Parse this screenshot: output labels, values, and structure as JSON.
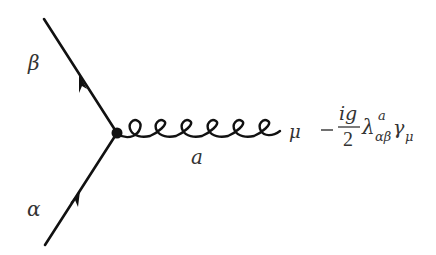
{
  "diagram": {
    "type": "feynman-vertex",
    "vertex": {
      "x": 117,
      "y": 133
    },
    "fermion_lines": [
      {
        "name": "outgoing-quark",
        "from": {
          "x": 117,
          "y": 133
        },
        "to": {
          "x": 44,
          "y": 19
        },
        "label": "β",
        "arrow_direction": "away-from-vertex"
      },
      {
        "name": "incoming-quark",
        "from": {
          "x": 45,
          "y": 245
        },
        "to": {
          "x": 117,
          "y": 133
        },
        "label": "α",
        "arrow_direction": "toward-vertex"
      }
    ],
    "gluon_line": {
      "from": {
        "x": 117,
        "y": 133
      },
      "to": {
        "x": 280,
        "y": 132
      },
      "loops": 6,
      "color_label": "a",
      "lorentz_label": "μ"
    },
    "vertex_factor": {
      "sign": "−",
      "numerator": "ig",
      "denominator": "2",
      "lambda": "λ",
      "lambda_superscript": "a",
      "lambda_subscript": "αβ",
      "gamma": "γ",
      "gamma_subscript": "μ"
    },
    "colors": {
      "line": "#111111",
      "text": "#333333",
      "background": "#ffffff"
    }
  }
}
